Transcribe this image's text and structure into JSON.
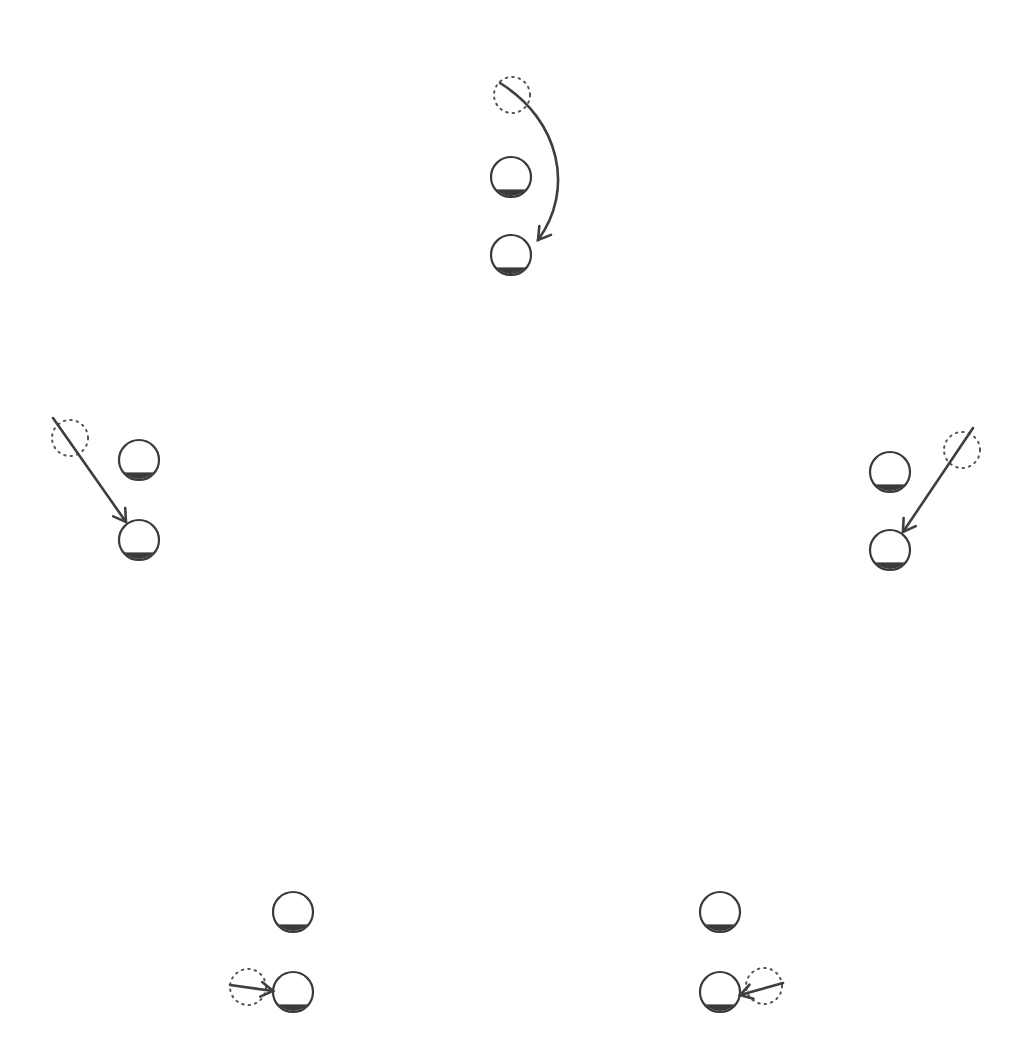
{
  "diagram": {
    "colors": {
      "stroke": "#3a3a3a",
      "background": "#ffffff"
    },
    "groups": [
      {
        "id": "top",
        "dotted": {
          "cx": 512,
          "cy": 95,
          "r": 18
        },
        "reference": {
          "cx": 511,
          "cy": 177,
          "r": 20
        },
        "target": {
          "cx": 511,
          "cy": 255,
          "r": 20
        },
        "arrow": {
          "type": "curve",
          "path": "M500,83 C 560,120 575,190 538,240",
          "head": [
            538,
            240
          ],
          "head_dir": [
            -0.6,
            0.8
          ]
        }
      },
      {
        "id": "left",
        "dotted": {
          "cx": 70,
          "cy": 438,
          "r": 18
        },
        "reference": {
          "cx": 139,
          "cy": 460,
          "r": 20
        },
        "target": {
          "cx": 139,
          "cy": 540,
          "r": 20
        },
        "arrow": {
          "type": "line",
          "path": "M53,418 L126,522",
          "head": [
            126,
            522
          ],
          "head_dir": [
            0.57,
            0.82
          ]
        }
      },
      {
        "id": "right",
        "dotted": {
          "cx": 962,
          "cy": 450,
          "r": 18
        },
        "reference": {
          "cx": 890,
          "cy": 472,
          "r": 20
        },
        "target": {
          "cx": 890,
          "cy": 550,
          "r": 20
        },
        "arrow": {
          "type": "line",
          "path": "M973,428 L903,532",
          "head": [
            903,
            532
          ],
          "head_dir": [
            -0.56,
            0.83
          ]
        }
      },
      {
        "id": "bottom-left",
        "dotted": {
          "cx": 248,
          "cy": 987,
          "r": 18
        },
        "reference": {
          "cx": 293,
          "cy": 912,
          "r": 20
        },
        "target": {
          "cx": 293,
          "cy": 992,
          "r": 20
        },
        "arrow": {
          "type": "line",
          "path": "M230,985 L273,991",
          "head": [
            273,
            991
          ],
          "head_dir": [
            0.99,
            0.14
          ]
        }
      },
      {
        "id": "bottom-right",
        "dotted": {
          "cx": 764,
          "cy": 986,
          "r": 18
        },
        "reference": {
          "cx": 720,
          "cy": 912,
          "r": 20
        },
        "target": {
          "cx": 720,
          "cy": 992,
          "r": 20
        },
        "arrow": {
          "type": "line",
          "path": "M783,983 L740,995",
          "head": [
            740,
            995
          ],
          "head_dir": [
            -0.96,
            0.27
          ]
        }
      }
    ]
  }
}
